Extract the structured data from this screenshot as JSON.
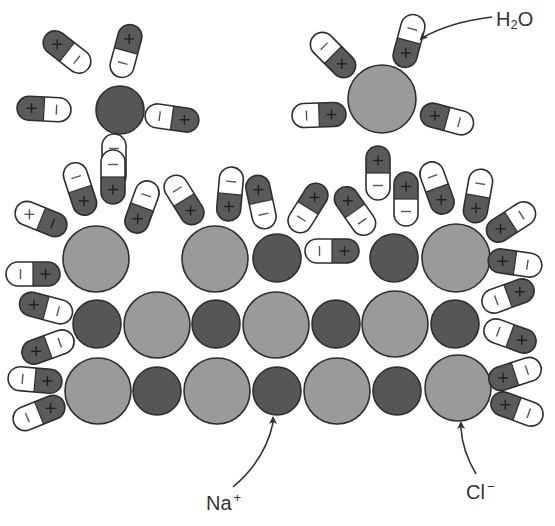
{
  "colors": {
    "na": "#565656",
    "cl": "#9a9a9a",
    "water_positive": "#5a5a5a",
    "water_negative": "#ffffff",
    "stroke": "#2e2e2e",
    "label": "#333333"
  },
  "labels": {
    "water": {
      "main": "H",
      "sub": "2",
      "tail": "O",
      "x": 496,
      "y": 9
    },
    "sodium": {
      "main": "Na",
      "sup": "+",
      "x": 206,
      "y": 491
    },
    "chloride": {
      "main": "Cl",
      "sup": "−",
      "x": 466,
      "y": 480
    }
  },
  "arrows": [
    {
      "name": "water-pointer-arrow",
      "path": "M 492 17 Q 450 22 422 38",
      "tip": [
        421,
        39
      ]
    },
    {
      "name": "sodium-pointer-arrow",
      "path": "M 233 487 Q 265 460 273 423",
      "tip": [
        273,
        418
      ]
    },
    {
      "name": "chloride-pointer-arrow",
      "path": "M 476 474 Q 462 450 461 428",
      "tip": [
        461,
        423
      ]
    }
  ],
  "ions": [
    {
      "type": "Na",
      "charge": "+",
      "cx": 120,
      "cy": 110,
      "r": 24,
      "group": "dissolved"
    },
    {
      "type": "Cl",
      "charge": "−",
      "cx": 382,
      "cy": 99,
      "r": 34,
      "group": "dissolved"
    },
    {
      "type": "Cl",
      "charge": "−",
      "cx": 96,
      "cy": 259,
      "r": 33,
      "group": "crystal-row-1"
    },
    {
      "type": "Cl",
      "charge": "−",
      "cx": 215,
      "cy": 259,
      "r": 33,
      "group": "crystal-row-1"
    },
    {
      "type": "Na",
      "charge": "+",
      "cx": 277,
      "cy": 258,
      "r": 24,
      "group": "crystal-row-1"
    },
    {
      "type": "Na",
      "charge": "+",
      "cx": 394,
      "cy": 258,
      "r": 24,
      "group": "crystal-row-1"
    },
    {
      "type": "Cl",
      "charge": "−",
      "cx": 456,
      "cy": 258,
      "r": 34,
      "group": "crystal-row-1"
    },
    {
      "type": "Na",
      "charge": "+",
      "cx": 97,
      "cy": 324,
      "r": 24,
      "group": "crystal-row-2"
    },
    {
      "type": "Cl",
      "charge": "−",
      "cx": 157,
      "cy": 325,
      "r": 33,
      "group": "crystal-row-2"
    },
    {
      "type": "Na",
      "charge": "+",
      "cx": 216,
      "cy": 324,
      "r": 24,
      "group": "crystal-row-2"
    },
    {
      "type": "Cl",
      "charge": "−",
      "cx": 276,
      "cy": 325,
      "r": 33,
      "group": "crystal-row-2"
    },
    {
      "type": "Na",
      "charge": "+",
      "cx": 336,
      "cy": 324,
      "r": 24,
      "group": "crystal-row-2"
    },
    {
      "type": "Cl",
      "charge": "−",
      "cx": 395,
      "cy": 324,
      "r": 33,
      "group": "crystal-row-2"
    },
    {
      "type": "Na",
      "charge": "+",
      "cx": 455,
      "cy": 324,
      "r": 24,
      "group": "crystal-row-2"
    },
    {
      "type": "Cl",
      "charge": "−",
      "cx": 98,
      "cy": 391,
      "r": 33,
      "group": "crystal-row-3"
    },
    {
      "type": "Na",
      "charge": "+",
      "cx": 157,
      "cy": 391,
      "r": 24,
      "group": "crystal-row-3"
    },
    {
      "type": "Cl",
      "charge": "−",
      "cx": 217,
      "cy": 391,
      "r": 33,
      "group": "crystal-row-3"
    },
    {
      "type": "Na",
      "charge": "+",
      "cx": 277,
      "cy": 391,
      "r": 24,
      "group": "crystal-row-3"
    },
    {
      "type": "Cl",
      "charge": "−",
      "cx": 337,
      "cy": 391,
      "r": 33,
      "group": "crystal-row-3"
    },
    {
      "type": "Na",
      "charge": "+",
      "cx": 397,
      "cy": 391,
      "r": 24,
      "group": "crystal-row-3"
    },
    {
      "type": "Cl",
      "charge": "−",
      "cx": 458,
      "cy": 388,
      "r": 33,
      "group": "crystal-row-3"
    }
  ],
  "water_molecules": [
    {
      "cx": 126,
      "cy": 51,
      "angle": 105,
      "pos": "+",
      "neg": "−"
    },
    {
      "cx": 67,
      "cy": 52,
      "angle": 38,
      "pos": "+",
      "neg": "−"
    },
    {
      "cx": 44,
      "cy": 109,
      "angle": 3,
      "pos": "+",
      "neg": "−"
    },
    {
      "cx": 172,
      "cy": 118,
      "angle": 188,
      "pos": "+",
      "neg": "−"
    },
    {
      "cx": 114,
      "cy": 161,
      "angle": 270,
      "pos": "+",
      "neg": "−"
    },
    {
      "cx": 333,
      "cy": 55,
      "angle": 225,
      "pos": "+",
      "neg": "−"
    },
    {
      "cx": 409,
      "cy": 41,
      "angle": 285,
      "pos": "+",
      "neg": "−"
    },
    {
      "cx": 319,
      "cy": 115,
      "angle": 178,
      "pos": "+",
      "neg": "−"
    },
    {
      "cx": 447,
      "cy": 119,
      "angle": 15,
      "pos": "+",
      "neg": "−"
    },
    {
      "cx": 378,
      "cy": 173,
      "angle": 90,
      "pos": "+",
      "neg": "−"
    },
    {
      "cx": 80,
      "cy": 189,
      "angle": 252,
      "pos": "+",
      "neg": "−"
    },
    {
      "cx": 113,
      "cy": 177,
      "angle": 270,
      "pos": "+",
      "neg": "−"
    },
    {
      "cx": 142,
      "cy": 207,
      "angle": 290,
      "pos": "+",
      "neg": "−"
    },
    {
      "cx": 41,
      "cy": 219,
      "angle": 202,
      "pos": "−",
      "neg": "+"
    },
    {
      "cx": 33,
      "cy": 274,
      "angle": 180,
      "pos": "+",
      "neg": "−"
    },
    {
      "cx": 46,
      "cy": 308,
      "angle": 15,
      "pos": "+",
      "neg": "−"
    },
    {
      "cx": 48,
      "cy": 347,
      "angle": 340,
      "pos": "+",
      "neg": "−"
    },
    {
      "cx": 35,
      "cy": 380,
      "angle": 185,
      "pos": "+",
      "neg": "−"
    },
    {
      "cx": 39,
      "cy": 413,
      "angle": 158,
      "pos": "+",
      "neg": "−"
    },
    {
      "cx": 184,
      "cy": 200,
      "angle": 238,
      "pos": "+",
      "neg": "−"
    },
    {
      "cx": 230,
      "cy": 194,
      "angle": 275,
      "pos": "+",
      "neg": "−"
    },
    {
      "cx": 261,
      "cy": 202,
      "angle": 78,
      "pos": "+",
      "neg": "−"
    },
    {
      "cx": 308,
      "cy": 208,
      "angle": 122,
      "pos": "+",
      "neg": "−"
    },
    {
      "cx": 355,
      "cy": 211,
      "angle": 55,
      "pos": "+",
      "neg": "−"
    },
    {
      "cx": 332,
      "cy": 251,
      "angle": 180,
      "pos": "+",
      "neg": "−"
    },
    {
      "cx": 406,
      "cy": 199,
      "angle": 90,
      "pos": "+",
      "neg": "−"
    },
    {
      "cx": 437,
      "cy": 188,
      "angle": 250,
      "pos": "+",
      "neg": "−"
    },
    {
      "cx": 478,
      "cy": 196,
      "angle": 280,
      "pos": "+",
      "neg": "−"
    },
    {
      "cx": 511,
      "cy": 222,
      "angle": 327,
      "pos": "+",
      "neg": "−"
    },
    {
      "cx": 515,
      "cy": 263,
      "angle": 8,
      "pos": "+",
      "neg": "−"
    },
    {
      "cx": 508,
      "cy": 296,
      "angle": 160,
      "pos": "+",
      "neg": "−"
    },
    {
      "cx": 510,
      "cy": 336,
      "angle": 200,
      "pos": "+",
      "neg": "−"
    },
    {
      "cx": 515,
      "cy": 374,
      "angle": 342,
      "pos": "+",
      "neg": "−"
    },
    {
      "cx": 517,
      "cy": 409,
      "angle": 20,
      "pos": "+",
      "neg": "−"
    }
  ],
  "water_size": {
    "length": 54,
    "width": 24
  }
}
